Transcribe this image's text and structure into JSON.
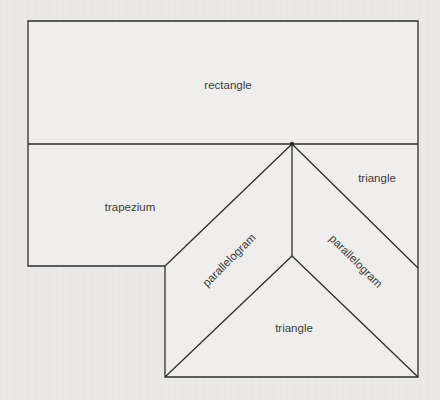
{
  "figure": {
    "background_color": "#eae9e7",
    "shape_fill_color": "#efeeec",
    "line_color": "#2e2e2e",
    "text_color": "#3c3c3c",
    "shapes": [
      {
        "id": "rectangle",
        "label": "rectangle",
        "vertices": [
          [
            28,
            21
          ],
          [
            418,
            21
          ],
          [
            418,
            144
          ],
          [
            28,
            144
          ]
        ],
        "label_center": [
          228,
          85
        ],
        "label_rotation_deg": 0
      },
      {
        "id": "trapezium",
        "label": "trapezium",
        "vertices": [
          [
            28,
            144
          ],
          [
            292,
            144
          ],
          [
            165,
            266
          ],
          [
            28,
            266
          ]
        ],
        "label_center": [
          130,
          207
        ],
        "label_rotation_deg": 0
      },
      {
        "id": "triangle-top-right",
        "label": "triangle",
        "vertices": [
          [
            292,
            144
          ],
          [
            418,
            144
          ],
          [
            418,
            268
          ]
        ],
        "label_center": [
          377,
          178
        ],
        "label_rotation_deg": 0
      },
      {
        "id": "parallelogram-left",
        "label": "parallelogram",
        "vertices": [
          [
            165,
            266
          ],
          [
            292,
            144
          ],
          [
            292,
            256
          ],
          [
            165,
            377
          ]
        ],
        "label_center": [
          229,
          260
        ],
        "label_rotation_deg": -45
      },
      {
        "id": "parallelogram-right",
        "label": "parallelogram",
        "vertices": [
          [
            292,
            144
          ],
          [
            418,
            268
          ],
          [
            418,
            377
          ],
          [
            292,
            256
          ]
        ],
        "label_center": [
          356,
          261
        ],
        "label_rotation_deg": 45
      },
      {
        "id": "triangle-bottom",
        "label": "triangle",
        "vertices": [
          [
            292,
            256
          ],
          [
            418,
            377
          ],
          [
            165,
            377
          ]
        ],
        "label_center": [
          294,
          328
        ],
        "label_rotation_deg": 0
      }
    ]
  }
}
